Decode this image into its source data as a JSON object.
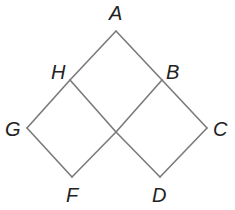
{
  "diagram": {
    "type": "geometry-figure",
    "line_color": "#7a7a7a",
    "label_color": "#222222",
    "vertices": {
      "A": {
        "label": "A",
        "x": 116,
        "y": 31
      },
      "B": {
        "label": "B",
        "x": 162,
        "y": 80
      },
      "C": {
        "label": "C",
        "x": 207,
        "y": 128
      },
      "D": {
        "label": "D",
        "x": 160,
        "y": 177
      },
      "F": {
        "label": "F",
        "x": 72,
        "y": 177
      },
      "G": {
        "label": "G",
        "x": 27,
        "y": 128
      },
      "H": {
        "label": "H",
        "x": 70,
        "y": 80
      },
      "O": {
        "label": "",
        "x": 116,
        "y": 132
      }
    },
    "labels": [
      {
        "id": "A",
        "text": "A",
        "x": 109,
        "y": 20
      },
      {
        "id": "H",
        "text": "H",
        "x": 51,
        "y": 79
      },
      {
        "id": "B",
        "text": "B",
        "x": 166,
        "y": 79
      },
      {
        "id": "G",
        "text": "G",
        "x": 5,
        "y": 136
      },
      {
        "id": "C",
        "text": "C",
        "x": 213,
        "y": 136
      },
      {
        "id": "F",
        "text": "F",
        "x": 66,
        "y": 202
      },
      {
        "id": "D",
        "text": "D",
        "x": 152,
        "y": 202
      }
    ],
    "segments": [
      {
        "name": "segment-a-h",
        "from": "A",
        "to": "H"
      },
      {
        "name": "segment-h-g",
        "from": "H",
        "to": "G"
      },
      {
        "name": "segment-g-f",
        "from": "G",
        "to": "F"
      },
      {
        "name": "segment-f-o",
        "from": "F",
        "to": "O"
      },
      {
        "name": "segment-o-b",
        "from": "O",
        "to": "B"
      },
      {
        "name": "segment-a-b",
        "from": "A",
        "to": "B"
      },
      {
        "name": "segment-b-c",
        "from": "B",
        "to": "C"
      },
      {
        "name": "segment-c-d",
        "from": "C",
        "to": "D"
      },
      {
        "name": "segment-d-o",
        "from": "D",
        "to": "O"
      },
      {
        "name": "segment-o-h",
        "from": "O",
        "to": "H"
      }
    ]
  }
}
